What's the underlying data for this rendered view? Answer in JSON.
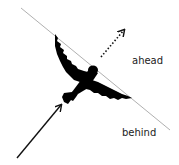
{
  "diagram": {
    "labels": {
      "ahead": "ahead",
      "behind": "behind"
    },
    "elements": {
      "boundary_line": "diagonal-dividing-line",
      "bird": "bird-silhouette",
      "incoming_arrow": "solid-arrow",
      "outgoing_arrow": "dotted-arrow"
    },
    "colors": {
      "line": "#b0b0b0",
      "bird": "#000000",
      "arrow": "#111111",
      "text": "#222222"
    }
  }
}
